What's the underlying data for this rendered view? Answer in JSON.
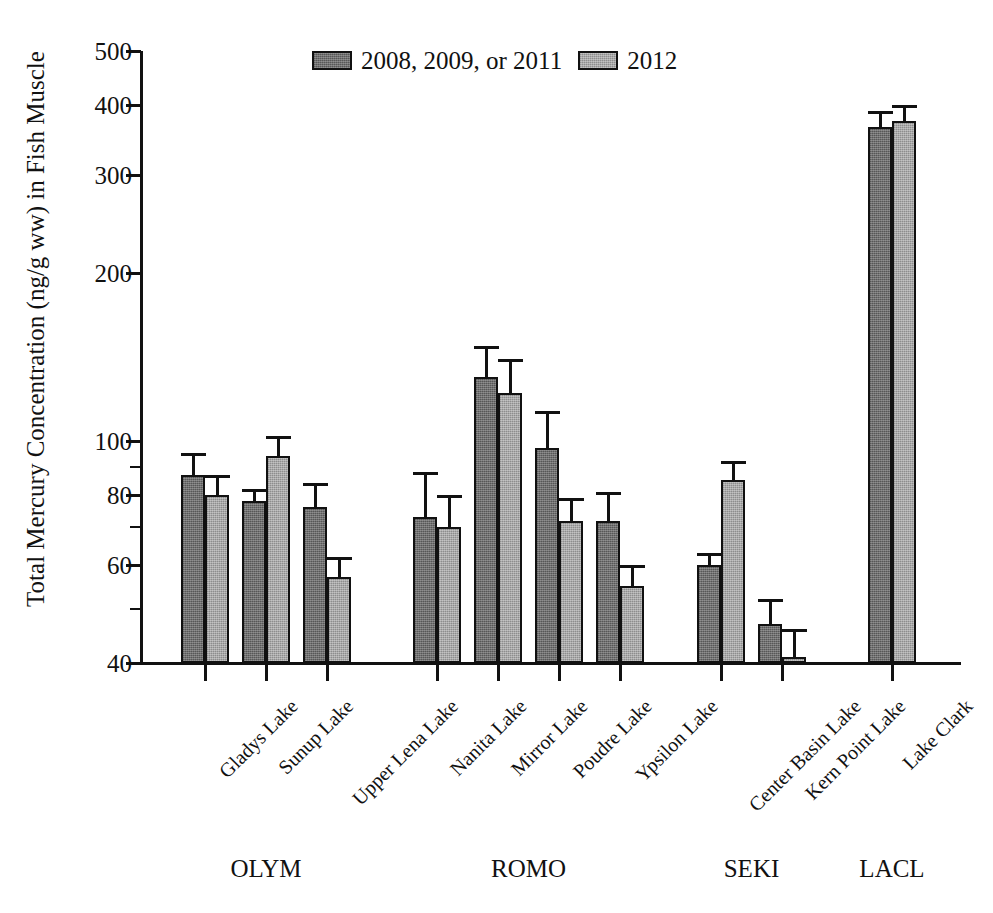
{
  "chart_data": {
    "type": "bar",
    "title": "",
    "xlabel": "",
    "ylabel": "Total Mercury Concentration (ng/g ww) in Fish Muscle",
    "yscale": "log",
    "ylim": [
      40,
      500
    ],
    "grid": false,
    "legend_position": "top-center",
    "y_ticks_major": [
      {
        "value": 500,
        "label": "500"
      },
      {
        "value": 400,
        "label": "400"
      },
      {
        "value": 300,
        "label": "300"
      },
      {
        "value": 200,
        "label": "200"
      },
      {
        "value": 100,
        "label": "100"
      },
      {
        "value": 80,
        "label": "80"
      },
      {
        "value": 60,
        "label": "60"
      },
      {
        "value": 40,
        "label": "40"
      }
    ],
    "y_ticks_minor": [
      90,
      70,
      50
    ],
    "categories": [
      "Gladys Lake",
      "Sunup Lake",
      "Upper Lena Lake",
      "Nanita Lake",
      "Mirror Lake",
      "Poudre Lake",
      "Ypsilon Lake",
      "Center Basin Lake",
      "Kern Point Lake",
      "Lake Clark"
    ],
    "groups": [
      {
        "label": "OLYM",
        "categories": [
          "Gladys Lake",
          "Sunup Lake",
          "Upper Lena Lake"
        ]
      },
      {
        "label": "ROMO",
        "categories": [
          "Nanita Lake",
          "Mirror Lake",
          "Poudre Lake",
          "Ypsilon Lake"
        ]
      },
      {
        "label": "SEKI",
        "categories": [
          "Center Basin Lake",
          "Kern Point Lake"
        ]
      },
      {
        "label": "LACL",
        "categories": [
          "Lake Clark"
        ]
      }
    ],
    "series": [
      {
        "name": "2008, 2009, or 2011",
        "color": "#6f6f6f",
        "values": [
          87,
          78,
          76,
          73,
          130,
          97,
          72,
          60,
          47,
          365
        ],
        "error_upper": [
          95,
          82,
          84,
          88,
          148,
          113,
          81,
          63,
          52,
          390
        ]
      },
      {
        "name": "2012",
        "color": "#a8a8a8",
        "values": [
          80,
          94,
          57,
          70,
          122,
          72,
          55,
          85,
          41,
          375
        ],
        "error_upper": [
          87,
          102,
          62,
          80,
          140,
          79,
          60,
          92,
          46,
          400
        ]
      }
    ]
  },
  "legend": {
    "items": [
      {
        "label": "2008, 2009, or 2011"
      },
      {
        "label": "2012"
      }
    ]
  }
}
